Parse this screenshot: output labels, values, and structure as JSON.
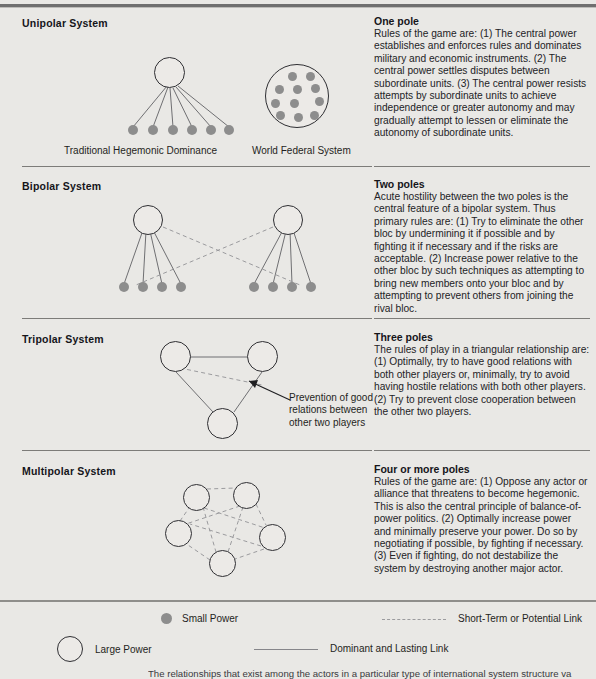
{
  "sections": [
    {
      "system_label": "Unipolar System",
      "pole_title": "One pole",
      "pole_body": "Rules of the game are: (1) The central power establishes and enforces rules and dominates military and economic instruments. (2) The central power settles disputes between subordinate units. (3) The central power resists attempts by subordinate units to achieve independence or greater autonomy and may gradually attempt to lessen or eliminate the autonomy of subordinate units.",
      "diagram_labels": [
        "Traditional Hegemonic Dominance",
        "World Federal System"
      ],
      "large_power_count": 2,
      "small_power_count": 17
    },
    {
      "system_label": "Bipolar System",
      "pole_title": "Two poles",
      "pole_body": "Acute hostility between the two poles is the central feature of a bipolar system. Thus primary rules are: (1) Try to eliminate the other bloc by undermining it if possible and by fighting it if necessary and if the risks are acceptable. (2) Increase power relative to the other bloc by such techniques as attempting to bring new members onto your bloc and by attempting to prevent others from joining the rival bloc.",
      "diagram_labels": [],
      "large_power_count": 2,
      "small_power_count": 8
    },
    {
      "system_label": "Tripolar System",
      "pole_title": "Three poles",
      "pole_body": "The rules of play in a triangular relationship are: (1) Optimally, try to have good relations with both other players or, minimally, try to avoid having hostile relations with both other players. (2) Try to prevent close cooperation between the other two players.",
      "annotation": "Prevention of good relations between other two players",
      "diagram_labels": [],
      "large_power_count": 3,
      "small_power_count": 0
    },
    {
      "system_label": "Multipolar System",
      "pole_title": "Four or more poles",
      "pole_body": "Rules of the game are: (1) Oppose any actor or alliance that threatens to become hegemonic. This is also the central principle of balance-of-power politics. (2) Optimally increase power and minimally preserve your power. Do so by negotiating if possible, by fighting if necessary. (3) Even if fighting, do not destabilize the system by destroying another major actor.",
      "diagram_labels": [],
      "large_power_count": 5,
      "small_power_count": 0
    }
  ],
  "legend": {
    "small_power": "Small Power",
    "large_power": "Large Power",
    "short_term_link": "Short-Term or Potential Link",
    "dominant_link": "Dominant and Lasting Link"
  },
  "caption": "The relationships that exist among the actors in a particular type of international system structure va",
  "colors": {
    "page_background": "#e9e8e5",
    "small_power_fill": "#8d8d8d",
    "large_power_stroke": "#2f2f33",
    "solid_link": "#6f6f72",
    "dashed_link": "#9b9b9e",
    "rule": "#7d7c79",
    "text": "#1c1c1c"
  }
}
